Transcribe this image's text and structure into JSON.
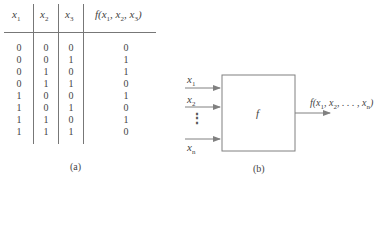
{
  "truth_table": {
    "headers": [
      {
        "base": "x",
        "sub": "1"
      },
      {
        "base": "x",
        "sub": "2"
      },
      {
        "base": "x",
        "sub": "3"
      },
      {
        "func": "f(x",
        "sub1": "1",
        "sep1": ", x",
        "sub2": "2",
        "sep2": ", x",
        "sub3": "3",
        "end": ")"
      }
    ],
    "rows": [
      [
        "0",
        "0",
        "0",
        "0"
      ],
      [
        "0",
        "0",
        "1",
        "1"
      ],
      [
        "0",
        "1",
        "0",
        "1"
      ],
      [
        "0",
        "1",
        "1",
        "0"
      ],
      [
        "1",
        "0",
        "0",
        "1"
      ],
      [
        "1",
        "0",
        "1",
        "0"
      ],
      [
        "1",
        "1",
        "0",
        "1"
      ],
      [
        "1",
        "1",
        "1",
        "0"
      ]
    ],
    "caption": "(a)"
  },
  "block_diagram": {
    "inputs": [
      {
        "base": "x",
        "sub": "1"
      },
      {
        "base": "x",
        "sub": "2"
      },
      {
        "base": "x",
        "sub": "n"
      }
    ],
    "ellipsis": "⋮",
    "function_label": "f",
    "output": {
      "func": "f(x",
      "sub1": "1",
      "sep1": ", x",
      "sub2": "2",
      "sep2": ", . . . , x",
      "subn": "n",
      "end": ")"
    },
    "caption": "(b)",
    "line_color": "#808080"
  }
}
